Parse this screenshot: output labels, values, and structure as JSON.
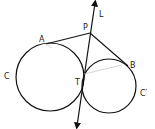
{
  "diagram": {
    "type": "geometry",
    "labels": {
      "L": "L",
      "P": "P",
      "A": "A",
      "B": "B",
      "C": "C",
      "C_prime": "C′",
      "T": "T"
    },
    "colors": {
      "stroke": "#111111",
      "faint": "#cccccc",
      "background": "#ffffff"
    },
    "circles": [
      {
        "name": "C",
        "cx": 50,
        "cy": 77,
        "r": 34
      },
      {
        "name": "C′",
        "cx": 109,
        "cy": 86,
        "r": 27
      }
    ],
    "points": {
      "P": [
        90,
        33
      ],
      "A": [
        46,
        44
      ],
      "B": [
        128,
        66
      ],
      "T": [
        83,
        76
      ]
    },
    "line_L": {
      "from": [
        95,
        2
      ],
      "to": [
        77,
        126
      ]
    }
  }
}
